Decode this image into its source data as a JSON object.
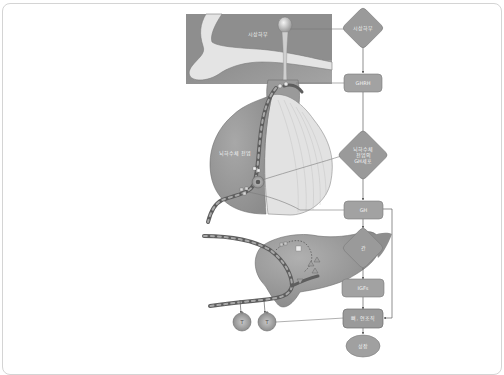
{
  "figure": {
    "colors": {
      "frame_border": "#d4d4d4",
      "tissue_dark": "#8a8a8a",
      "tissue_mid": "#9c9c9c",
      "tissue_light": "#dcdcdc",
      "node_fill": "#9a9a9a",
      "node_stroke": "#7a7a7a",
      "connector": "#6f6f6f"
    },
    "anatomy_labels": {
      "hypothalamus": "시상하부",
      "anterior_pituitary": "뇌하수체 전엽"
    },
    "flow_nodes": [
      {
        "id": "hypothalamus",
        "shape": "diamond",
        "label": "시상하부"
      },
      {
        "id": "ghrh",
        "shape": "rounded-rect",
        "label": "GHRH"
      },
      {
        "id": "pituitary-cells",
        "shape": "diamond",
        "label_lines": [
          "뇌하수체",
          "전엽의",
          "GH세포"
        ]
      },
      {
        "id": "gh",
        "shape": "rounded-rect",
        "label": "GH"
      },
      {
        "id": "liver",
        "shape": "diamond",
        "label": "간"
      },
      {
        "id": "igfs",
        "shape": "rounded-rect",
        "label": "IGFs"
      },
      {
        "id": "bone-soft-tissue",
        "shape": "rounded-rect",
        "label": "뼈, 연조직"
      },
      {
        "id": "growth",
        "shape": "ellipse",
        "label": "성장"
      }
    ],
    "target_cells": [
      {
        "label": "T"
      },
      {
        "label": "T"
      }
    ]
  }
}
